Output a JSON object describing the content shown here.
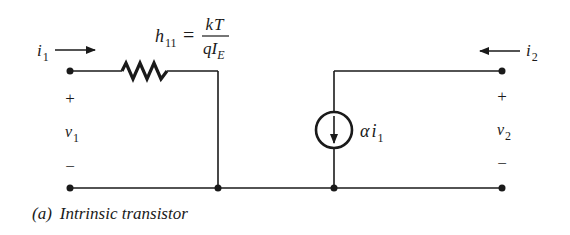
{
  "diagram": {
    "type": "circuit",
    "caption": {
      "label": "(a)",
      "text": "Intrinsic transistor"
    },
    "resistor": {
      "name_base": "h",
      "name_sub": "11",
      "equals": "=",
      "numerator": "kT",
      "denominator_base": "qI",
      "denominator_sub": "E"
    },
    "current_source": {
      "label_greek": "α",
      "label_var": "i",
      "label_sub": "1"
    },
    "port1": {
      "current_base": "i",
      "current_sub": "1",
      "voltage_base": "v",
      "voltage_sub": "1",
      "plus": "+",
      "minus": "−"
    },
    "port2": {
      "current_base": "i",
      "current_sub": "2",
      "voltage_base": "v",
      "voltage_sub": "2",
      "plus": "+",
      "minus": "−"
    },
    "colors": {
      "line": "#1a1a1a",
      "background": "#ffffff"
    }
  }
}
